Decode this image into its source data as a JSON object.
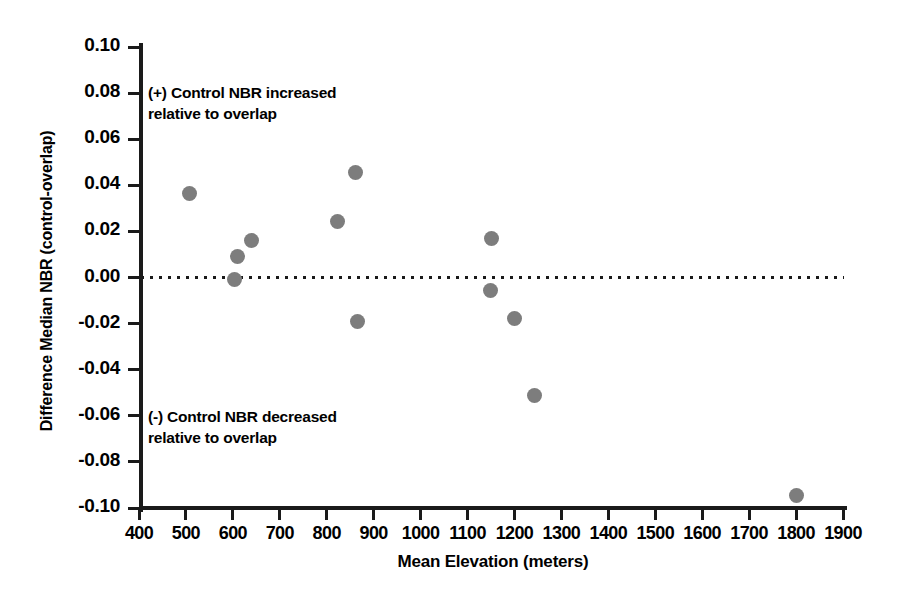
{
  "chart_data": {
    "type": "scatter",
    "title": "",
    "xlabel": "Mean Elevation (meters)",
    "ylabel": "Difference Median NBR (control-overlap)",
    "xlim": [
      400,
      1900
    ],
    "ylim": [
      -0.1,
      0.1
    ],
    "xticks": [
      400,
      500,
      600,
      700,
      800,
      900,
      1000,
      1100,
      1200,
      1300,
      1400,
      1500,
      1600,
      1700,
      1800,
      1900
    ],
    "xtick_labels": [
      "400",
      "500",
      "600",
      "700",
      "800",
      "900",
      "1000",
      "1100",
      "1200",
      "1300",
      "1400",
      "1500",
      "1600",
      "1700",
      "1800",
      "1900"
    ],
    "yticks": [
      0.1,
      0.08,
      0.06,
      0.04,
      0.02,
      0.0,
      -0.02,
      -0.04,
      -0.06,
      -0.08,
      -0.1
    ],
    "ytick_labels": [
      "0.10",
      "0.08",
      "0.06",
      "0.04",
      "0.02",
      "0.00",
      "-0.02",
      "-0.04",
      "-0.06",
      "-0.08",
      "-0.10"
    ],
    "grid": false,
    "legend": null,
    "marker_color": "#7d7d7d",
    "reference_line": {
      "y": 0.0,
      "style": "dotted",
      "color": "#1a1a1a"
    },
    "points": [
      {
        "x": 508,
        "y": 0.0365
      },
      {
        "x": 609,
        "y": 0.009
      },
      {
        "x": 604,
        "y": -0.001
      },
      {
        "x": 640,
        "y": 0.0162
      },
      {
        "x": 824,
        "y": 0.0245
      },
      {
        "x": 862,
        "y": 0.0455
      },
      {
        "x": 865,
        "y": -0.0192
      },
      {
        "x": 1151,
        "y": 0.017
      },
      {
        "x": 1148,
        "y": -0.0055
      },
      {
        "x": 1200,
        "y": -0.018
      },
      {
        "x": 1243,
        "y": -0.0512
      },
      {
        "x": 1800,
        "y": -0.0945
      }
    ],
    "annotations": [
      {
        "name": "positive",
        "text": "(+) Control NBR increased\nrelative to overlap"
      },
      {
        "name": "negative",
        "text": "(-) Control NBR decreased\nrelative to overlap"
      }
    ]
  }
}
